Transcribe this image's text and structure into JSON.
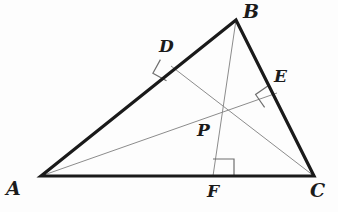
{
  "figure": {
    "kind": "geometry-diagram",
    "background_color": "#fdfdfd",
    "width": 338,
    "height": 212
  },
  "style": {
    "triangle_stroke_color": "#1a1a1a",
    "triangle_stroke_width": 3.2,
    "cevian_stroke_color": "#8c8c8c",
    "cevian_stroke_width": 1.0,
    "right_angle_stroke_color": "#6f6f6f",
    "right_angle_stroke_width": 1.2,
    "label_color": "#1b1b1b"
  },
  "points": {
    "A": {
      "label": "A",
      "x": 41,
      "y": 176,
      "label_x": 6,
      "label_y": 179,
      "size": "big"
    },
    "B": {
      "label": "B",
      "x": 236,
      "y": 20,
      "label_x": 243,
      "label_y": 2,
      "size": "big"
    },
    "C": {
      "label": "C",
      "x": 314,
      "y": 176,
      "label_x": 310,
      "label_y": 181,
      "size": "big"
    },
    "D": {
      "label": "D",
      "x": 171,
      "y": 66,
      "label_x": 159,
      "label_y": 38,
      "size": "med"
    },
    "E": {
      "label": "E",
      "x": 277,
      "y": 93,
      "label_x": 274,
      "label_y": 68,
      "size": "med"
    },
    "F": {
      "label": "F",
      "x": 213,
      "y": 176,
      "label_x": 207,
      "label_y": 183,
      "size": "med"
    },
    "P": {
      "label": "P",
      "x": 214,
      "y": 113,
      "label_x": 197,
      "label_y": 122,
      "size": "med"
    }
  },
  "triangle": {
    "name": "triangle-abc",
    "vertices": "41,176 236,20 314,176"
  },
  "segments": [
    {
      "name": "segment-bf",
      "from": "B",
      "to": "F",
      "x1": 236,
      "y1": 20,
      "x2": 213,
      "y2": 176
    },
    {
      "name": "segment-ae",
      "from": "A",
      "to": "E",
      "x1": 41,
      "y1": 176,
      "x2": 277,
      "y2": 93
    },
    {
      "name": "segment-cd",
      "from": "C",
      "to": "D",
      "x1": 314,
      "y1": 176,
      "x2": 171,
      "y2": 66
    }
  ],
  "right_angles": [
    {
      "name": "right-angle-at-d",
      "at": "D",
      "path": "M 160.4 59.6 L 152.9 73.3 L 166.5 80.8"
    },
    {
      "name": "right-angle-at-e",
      "at": "E",
      "path": "M 268.5 85.5 L 255.6 94.5 L 264.6 107.4"
    },
    {
      "name": "right-angle-at-f",
      "at": "F",
      "path": "M 234.0 176.0 L 234.0 159.0 L 213.0 159.0"
    }
  ]
}
